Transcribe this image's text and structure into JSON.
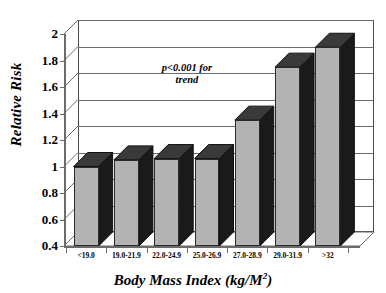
{
  "chart_data": {
    "type": "bar",
    "title": "",
    "xlabel": "Body Mass Index (kg/M2)",
    "xlabel_base": "Body Mass Index (kg/M",
    "xlabel_sup": "2",
    "xlabel_close": ")",
    "ylabel": "Relative Risk",
    "categories": [
      "<19.0",
      "19.0-21.9",
      "22.0-24.9",
      "25.0-26.9",
      "27.0-28.9",
      "29.0-31.9",
      ">32"
    ],
    "values": [
      1.0,
      1.05,
      1.06,
      1.06,
      1.35,
      1.75,
      1.9
    ],
    "ylim": [
      0.4,
      2.0
    ],
    "yticks": [
      "0.4",
      "0.6",
      "0.8",
      "1",
      "1.2",
      "1.4",
      "1.6",
      "1.8",
      "2"
    ],
    "ytick_values": [
      0.4,
      0.6,
      0.8,
      1.0,
      1.2,
      1.4,
      1.6,
      1.8,
      2.0
    ],
    "grid": true,
    "legend": "none",
    "annotations": [
      {
        "line1": "p<0.001 for",
        "line2": "trend"
      }
    ],
    "style": {
      "bar_front_color": "#b3b3b3",
      "bar_side_color": "#1a1a1a",
      "bar_top_color": "#3a3a3a",
      "axis_color": "#6b6b6b",
      "grid_color": "#6b6b6b",
      "background": "#ffffff",
      "three_d": true
    }
  }
}
